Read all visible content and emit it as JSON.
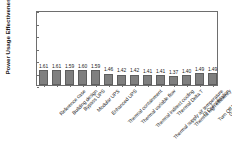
{
  "chart_data": {
    "type": "bar",
    "title": "",
    "xlabel": "",
    "ylabel": "Power Usage Effectiveness [-]",
    "ylim": [
      1,
      4
    ],
    "yticks": [
      "1",
      "1.5",
      "2",
      "2.5",
      "3",
      "3.5",
      "4"
    ],
    "grid": false,
    "legend": null,
    "bar_color": "#7f7f7f",
    "categories": [
      "Reference case",
      "Building design",
      "Bypass UPS",
      "Modular UPS",
      "Enhanced UPS",
      "Thermal containment",
      "Thermal variable flow",
      "Thermal indirect cooling",
      "Thermal supply air temperature",
      "Thermal Delta T",
      "Thermal high efficiency",
      "IT Consolidation",
      "Turn Off Idle Server",
      "Green Algorithm"
    ],
    "values": [
      1.61,
      1.61,
      1.59,
      1.6,
      1.59,
      1.46,
      1.42,
      1.42,
      1.41,
      1.41,
      1.37,
      1.4,
      1.49,
      1.49
    ],
    "value_labels": [
      "1.61",
      "1.61",
      "1.59",
      "1.60",
      "1.59",
      "1.46",
      "1.42",
      "1.42",
      "1.41",
      "1.41",
      "1.37",
      "1.40",
      "1.49",
      "1.49"
    ]
  }
}
